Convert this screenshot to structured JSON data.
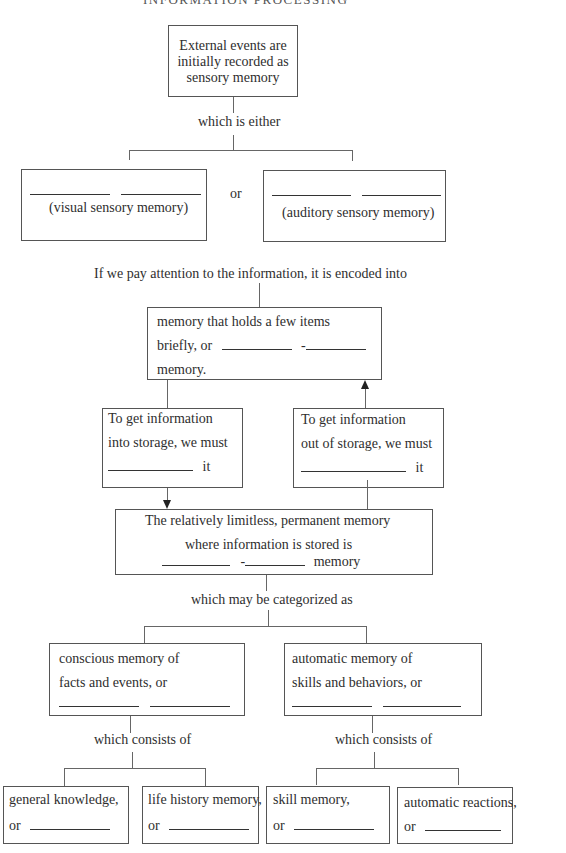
{
  "header": {
    "title_cut_off": "INFORMATION PROCESSING"
  },
  "sensory": {
    "line1": "External events are",
    "line2": "initially recorded as",
    "line3": "sensory memory",
    "connector": "which is either"
  },
  "visual_box": {
    "caption": "(visual sensory memory)"
  },
  "or_label": "or",
  "auditory_box": {
    "caption": "(auditory sensory memory)"
  },
  "attention_text": "If we pay attention to the information, it is encoded into",
  "short_term_box": {
    "line1": "memory that holds a few  items",
    "line2_prefix": "briefly, or",
    "line2_dash": "-",
    "line3": "memory."
  },
  "into_storage_box": {
    "line1": "To get information",
    "line2": "into storage, we must",
    "line3_suffix": "it"
  },
  "out_storage_box": {
    "line1": "To get information",
    "line2": "out of storage, we must",
    "line3_suffix": "it"
  },
  "long_term_box": {
    "line1": "The relatively limitless, permanent memory",
    "line2": "where information is stored is",
    "line3_dash": "-",
    "line3_suffix": "memory"
  },
  "categorized_text": "which may be categorized as",
  "explicit_box": {
    "line1": "conscious memory of",
    "line2": "facts and events, or"
  },
  "implicit_box": {
    "line1": "automatic memory of",
    "line2": "skills and behaviors, or"
  },
  "consists_left": "which consists of",
  "consists_right": "which consists of",
  "leaf_boxes": [
    {
      "line1": "general knowledge,",
      "line2_prefix": "or"
    },
    {
      "line1": "life history memory,",
      "line2_prefix": "or"
    },
    {
      "line1": "skill memory,",
      "line2_prefix": "or"
    },
    {
      "line1": "automatic reactions,",
      "line2_prefix": "or"
    }
  ]
}
